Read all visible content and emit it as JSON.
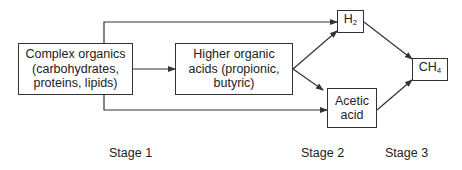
{
  "nodes": {
    "complex_organics": {
      "line1": "Complex organics",
      "line2": "(carbohydrates,",
      "line3": "proteins, lipids)"
    },
    "higher_acids": {
      "line1": "Higher organic",
      "line2": "acids (propionic,",
      "line3": "butyric)"
    },
    "h2": {
      "base": "H",
      "sub": "2"
    },
    "acetic_acid": {
      "line1": "Acetic",
      "line2": "acid"
    },
    "ch4": {
      "base": "CH",
      "sub": "4"
    }
  },
  "stages": [
    "Stage 1",
    "Stage 2",
    "Stage 3"
  ],
  "colors": {
    "line": "#333333",
    "text": "#222222",
    "background": "#ffffff"
  }
}
